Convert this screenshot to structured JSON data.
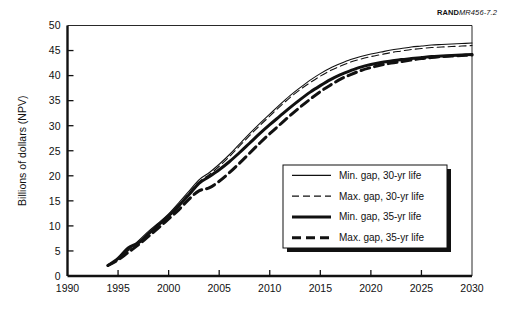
{
  "figure": {
    "source_note_bold": "RAND",
    "source_note_italic": "MR456-7.2"
  },
  "chart_data": {
    "type": "line",
    "title": "",
    "xlabel": "",
    "ylabel": "Billions of dollars (NPV)",
    "xlim": [
      1990,
      2030
    ],
    "ylim": [
      0,
      50
    ],
    "xticks": [
      1990,
      1995,
      2000,
      2005,
      2010,
      2015,
      2020,
      2025,
      2030
    ],
    "yticks": [
      0,
      5,
      10,
      15,
      20,
      25,
      30,
      35,
      40,
      45,
      50
    ],
    "grid": false,
    "legend_position": "lower right",
    "x": [
      1994,
      1995,
      1996,
      1997,
      1998,
      1999,
      2000,
      2001,
      2002,
      2003,
      2004,
      2005,
      2006,
      2007,
      2008,
      2009,
      2010,
      2011,
      2012,
      2013,
      2014,
      2015,
      2016,
      2017,
      2018,
      2019,
      2020,
      2021,
      2022,
      2023,
      2024,
      2025,
      2026,
      2027,
      2028,
      2029,
      2030
    ],
    "series": [
      {
        "name": "Min. gap, 30-yr life",
        "style": "solid-thin",
        "values": [
          2.1,
          3.4,
          5.2,
          7.0,
          8.9,
          10.6,
          12.4,
          14.6,
          16.9,
          19.2,
          20.6,
          22.3,
          24.2,
          26.3,
          28.4,
          30.4,
          32.3,
          34.2,
          36.0,
          37.6,
          39.1,
          40.4,
          41.5,
          42.4,
          43.2,
          43.8,
          44.3,
          44.7,
          45.1,
          45.4,
          45.7,
          45.9,
          46.1,
          46.2,
          46.3,
          46.4,
          46.5
        ]
      },
      {
        "name": "Max. gap, 30-yr life",
        "style": "dashed-thin",
        "values": [
          2.1,
          3.3,
          5.0,
          6.7,
          8.5,
          10.2,
          12.0,
          14.2,
          16.5,
          18.8,
          20.2,
          21.9,
          23.8,
          25.9,
          28.0,
          30.0,
          31.9,
          33.8,
          35.6,
          37.2,
          38.6,
          39.9,
          41.0,
          41.9,
          42.7,
          43.3,
          43.8,
          44.2,
          44.6,
          44.9,
          45.2,
          45.4,
          45.6,
          45.7,
          45.8,
          45.9,
          46.0
        ]
      },
      {
        "name": "Min. gap, 35-yr life",
        "style": "solid-thick",
        "values": [
          2.1,
          3.5,
          5.6,
          6.6,
          8.4,
          10.2,
          12.0,
          14.0,
          16.2,
          18.5,
          19.8,
          21.2,
          22.8,
          24.6,
          26.5,
          28.4,
          30.2,
          31.9,
          33.6,
          35.2,
          36.7,
          38.0,
          39.2,
          40.2,
          41.0,
          41.7,
          42.2,
          42.6,
          42.9,
          43.2,
          43.4,
          43.6,
          43.8,
          43.9,
          44.0,
          44.1,
          44.2
        ]
      },
      {
        "name": "Max. gap, 35-yr life",
        "style": "dashed-thick",
        "values": [
          2.1,
          3.2,
          4.7,
          6.2,
          7.9,
          9.6,
          11.4,
          13.2,
          15.3,
          17.0,
          17.6,
          18.9,
          20.6,
          22.5,
          24.5,
          26.5,
          28.4,
          30.2,
          32.0,
          33.7,
          35.3,
          36.8,
          38.1,
          39.3,
          40.2,
          41.0,
          41.6,
          42.1,
          42.5,
          42.8,
          43.1,
          43.4,
          43.6,
          43.8,
          43.9,
          44.0,
          44.1
        ]
      }
    ],
    "legend_entries": [
      {
        "label": "Min. gap, 30-yr life",
        "style": "solid-thin"
      },
      {
        "label": "Max. gap, 30-yr life",
        "style": "dashed-thin"
      },
      {
        "label": "Min. gap, 35-yr life",
        "style": "solid-thick"
      },
      {
        "label": "Max. gap, 35-yr life",
        "style": "dashed-thick"
      }
    ]
  }
}
